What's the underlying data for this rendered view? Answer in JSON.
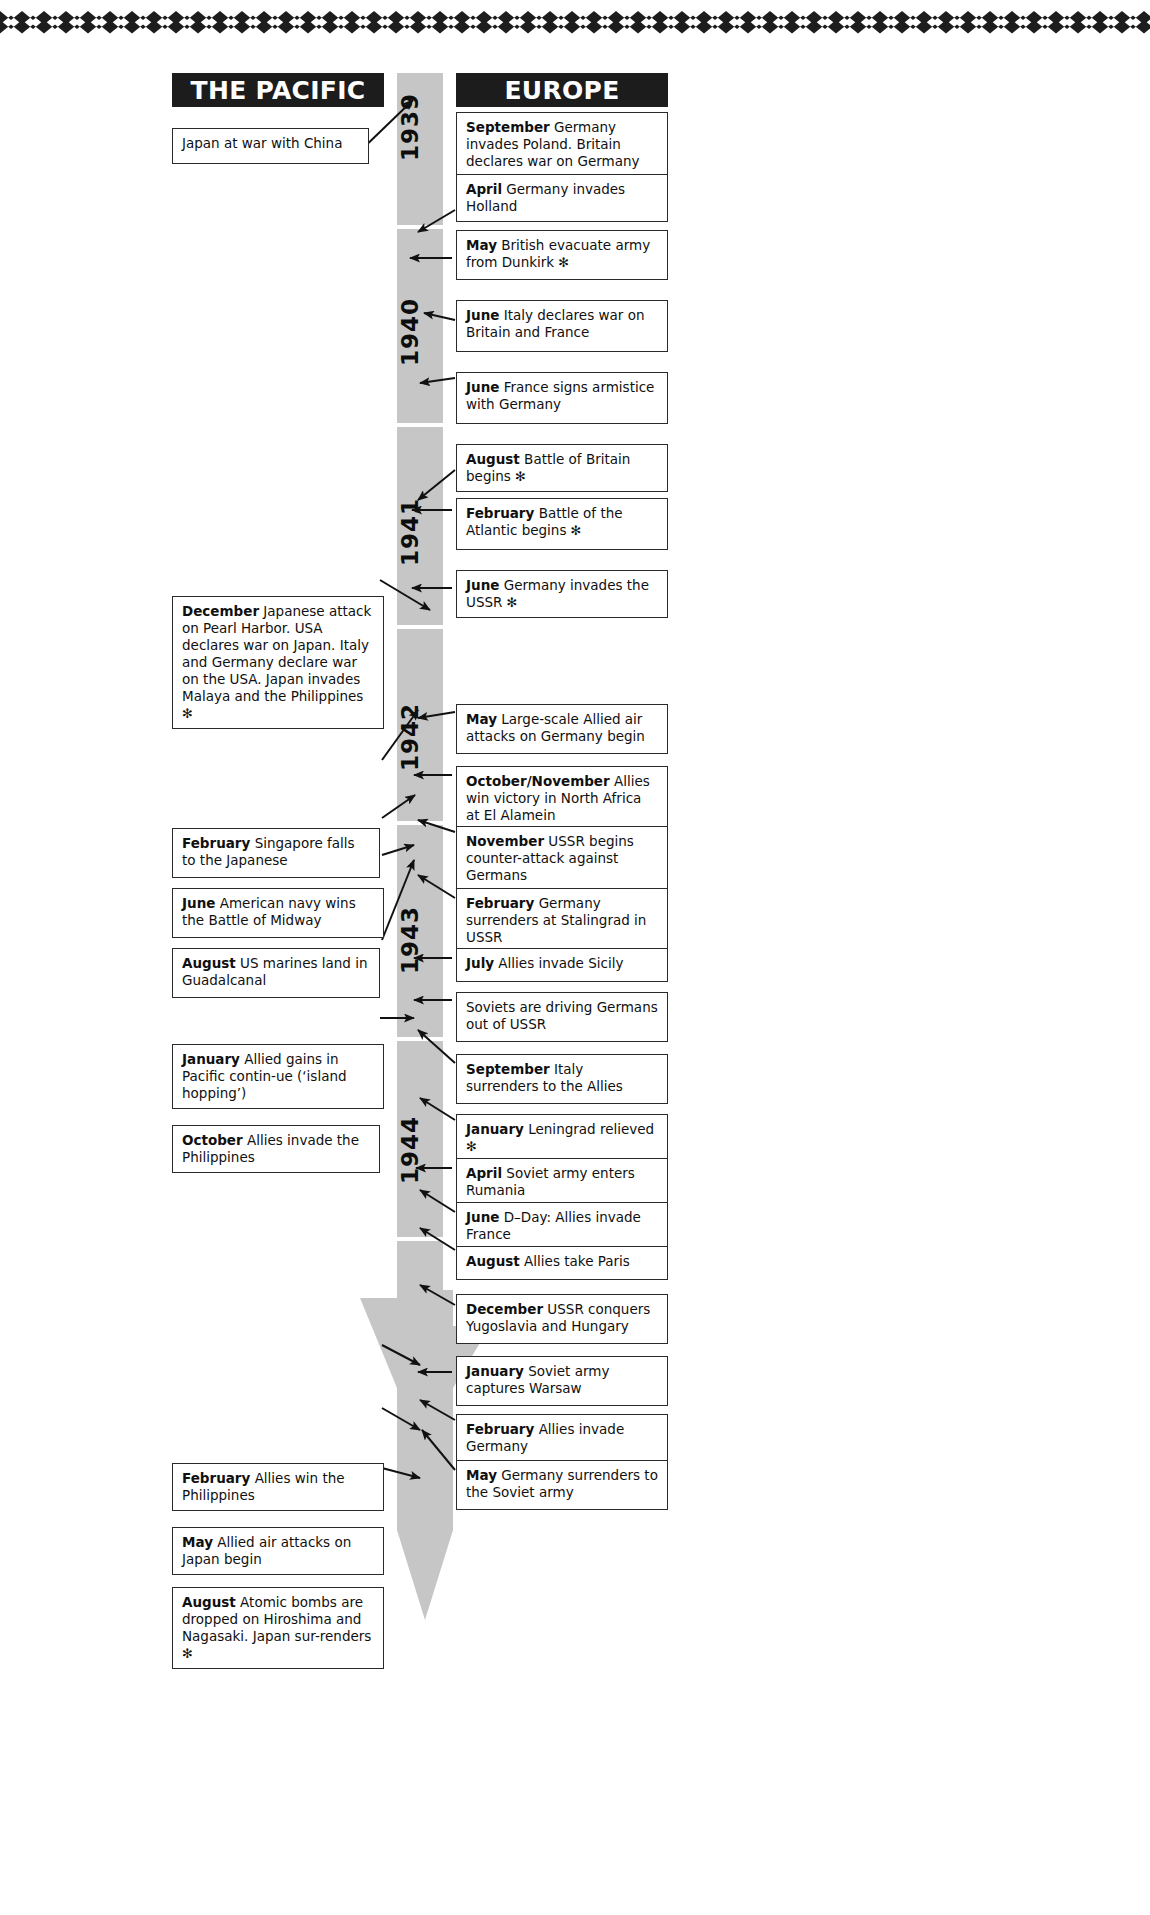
{
  "page": {
    "decor": {
      "top_rule": "zigzag-rule"
    },
    "colors": {
      "header_bg": "#1c1c1c",
      "header_text": "#ffffff",
      "band": "#c6c6c6",
      "box_border": "#2a2a2a",
      "text": "#101010"
    }
  },
  "columns": {
    "left": {
      "label": "THE PACIFIC"
    },
    "right": {
      "label": "EUROPE"
    }
  },
  "timeline": {
    "years": [
      "1939",
      "1940",
      "1941",
      "1942",
      "1943",
      "1944",
      "1945"
    ]
  },
  "pacific_events": [
    {
      "id": "pac-1",
      "month": "",
      "text": "Japan at war with China",
      "star": false
    },
    {
      "id": "pac-2",
      "month": "December",
      "text": " Japanese attack on Pearl Harbor. USA declares war on Japan. Italy and Germany declare war on the USA. Japan invades Malaya and the Philippines",
      "star": true
    },
    {
      "id": "pac-3",
      "month": "February",
      "text": " Singapore falls to the Japanese",
      "star": false
    },
    {
      "id": "pac-4",
      "month": "June",
      "text": " American navy wins the Battle of Midway",
      "star": false
    },
    {
      "id": "pac-5",
      "month": "August",
      "text": " US marines land in Guadalcanal",
      "star": false
    },
    {
      "id": "pac-6",
      "month": "January",
      "text": " Allied gains in Pacific contin-ue (‘island hopping’)",
      "star": false
    },
    {
      "id": "pac-7",
      "month": "October",
      "text": " Allies invade the Philippines",
      "star": false
    },
    {
      "id": "pac-8",
      "month": "February",
      "text": " Allies win the Philippines",
      "star": false
    },
    {
      "id": "pac-9",
      "month": "May",
      "text": " Allied air attacks on Japan begin",
      "star": false
    },
    {
      "id": "pac-10",
      "month": "August",
      "text": " Atomic bombs are dropped on Hiroshima and Nagasaki. Japan sur-renders",
      "star": true
    }
  ],
  "europe_events": [
    {
      "id": "eur-1",
      "month": "September",
      "text": " Germany invades Poland. Britain declares war on Germany",
      "star": false
    },
    {
      "id": "eur-2",
      "month": "April",
      "text": " Germany invades Holland",
      "star": false
    },
    {
      "id": "eur-3",
      "month": "May",
      "text": " British evacuate army from Dunkirk",
      "star": true
    },
    {
      "id": "eur-4",
      "month": "June",
      "text": " Italy declares war on Britain and France",
      "star": false
    },
    {
      "id": "eur-5",
      "month": "June",
      "text": " France signs armistice with Germany",
      "star": false
    },
    {
      "id": "eur-6",
      "month": "August",
      "text": " Battle of Britain begins",
      "star": true
    },
    {
      "id": "eur-7",
      "month": "February",
      "text": " Battle of the Atlantic begins",
      "star": true
    },
    {
      "id": "eur-8",
      "month": "June",
      "text": " Germany invades the USSR",
      "star": true
    },
    {
      "id": "eur-9",
      "month": "May",
      "text": " Large-scale Allied air attacks on Germany begin",
      "star": false
    },
    {
      "id": "eur-10",
      "month": "October/November",
      "text": " Allies win victory in North Africa at  El Alamein",
      "star": false
    },
    {
      "id": "eur-11",
      "month": "November",
      "text": " USSR begins counter-attack against Germans",
      "star": false
    },
    {
      "id": "eur-12",
      "month": "February",
      "text": " Germany surrenders at Stalingrad in USSR",
      "star": false
    },
    {
      "id": "eur-13",
      "month": "July",
      "text": " Allies invade Sicily",
      "star": false
    },
    {
      "id": "eur-14",
      "month": "",
      "text": "Soviets are driving Germans out of USSR",
      "star": false
    },
    {
      "id": "eur-15",
      "month": "September",
      "text": " Italy surrenders to the Allies",
      "star": false
    },
    {
      "id": "eur-16",
      "month": "January",
      "text": " Leningrad relieved",
      "star": true
    },
    {
      "id": "eur-17",
      "month": "April",
      "text": " Soviet army enters Rumania",
      "star": false
    },
    {
      "id": "eur-18",
      "month": "June",
      "text": " D–Day: Allies invade France",
      "star": false
    },
    {
      "id": "eur-19",
      "month": "August",
      "text": " Allies take Paris",
      "star": false
    },
    {
      "id": "eur-20",
      "month": "December",
      "text": " USSR conquers Yugoslavia and Hungary",
      "star": false
    },
    {
      "id": "eur-21",
      "month": "January",
      "text": " Soviet army captures Warsaw",
      "star": false
    },
    {
      "id": "eur-22",
      "month": "February",
      "text": " Allies invade Germany",
      "star": false
    },
    {
      "id": "eur-23",
      "month": "May",
      "text": " Germany surrenders to the Soviet army",
      "star": false
    }
  ]
}
